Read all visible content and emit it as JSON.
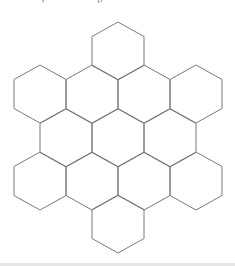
{
  "diagram": {
    "type": "hexagon-grid",
    "orientation": "pointy-top",
    "stroke_color": "#7a7a7a",
    "background": "#ffffff",
    "hex_radius": 29,
    "row_counts": [
      1,
      4,
      3,
      4,
      1
    ],
    "total_hexagons": 13,
    "hexagons": [
      {
        "row": 0,
        "cx": 118,
        "cy": 51
      },
      {
        "row": 1,
        "cx": 40,
        "cy": 94
      },
      {
        "row": 1,
        "cx": 92,
        "cy": 94
      },
      {
        "row": 1,
        "cx": 144,
        "cy": 94
      },
      {
        "row": 1,
        "cx": 196,
        "cy": 94
      },
      {
        "row": 2,
        "cx": 66,
        "cy": 138
      },
      {
        "row": 2,
        "cx": 118,
        "cy": 138
      },
      {
        "row": 2,
        "cx": 170,
        "cy": 138
      },
      {
        "row": 3,
        "cx": 40,
        "cy": 181
      },
      {
        "row": 3,
        "cx": 92,
        "cy": 181
      },
      {
        "row": 3,
        "cx": 144,
        "cy": 181
      },
      {
        "row": 3,
        "cx": 196,
        "cy": 181
      },
      {
        "row": 4,
        "cx": 118,
        "cy": 224
      }
    ]
  },
  "footer": {
    "bar_color": "#e6e6e6"
  }
}
